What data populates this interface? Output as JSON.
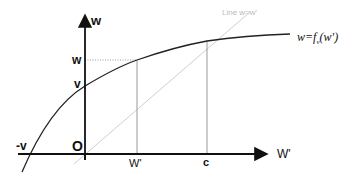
{
  "diagram": {
    "title": "",
    "axes": {
      "y_label": "w",
      "x_label": "W'",
      "origin_label": "O"
    },
    "ticks": {
      "y_w": "w",
      "y_v": "v",
      "x_neg_v": "-v",
      "x_w_prime": "W'",
      "x_c": "c"
    },
    "curve_label": {
      "main": "w=",
      "func": "f",
      "subscript": "v",
      "arg": "(w')"
    },
    "diagonal_label": "Line w=w'",
    "colors": {
      "axes": "#111111",
      "curve": "#222222",
      "diagonal": "#cccccc",
      "guides": "#999999"
    }
  }
}
